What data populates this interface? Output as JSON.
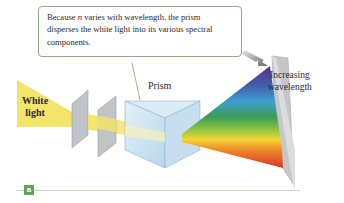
{
  "callout": {
    "text_before": "Because ",
    "variable": "n",
    "text_after": " varies with wavelength, the prism disperses the white light into its various spectral components."
  },
  "labels": {
    "white_light_line1": "White",
    "white_light_line2": "light",
    "prism": "Prism",
    "increasing_line1": "Increasing",
    "increasing_line2": "wavelength"
  },
  "panel": {
    "tag": "a"
  },
  "colors": {
    "callout_border": "#8fae7e",
    "white_light": "#f3e46a",
    "prism_fill": "#cfe4f2",
    "slit": "#b9bcc0",
    "screen": "#c4c6c9",
    "panel_tag": "#5fa35f",
    "spectrum": [
      "#5b2c83",
      "#3f62b0",
      "#3f9fcf",
      "#3a9b57",
      "#8cc540",
      "#f1d735",
      "#ef8a2a",
      "#d8332a"
    ]
  }
}
